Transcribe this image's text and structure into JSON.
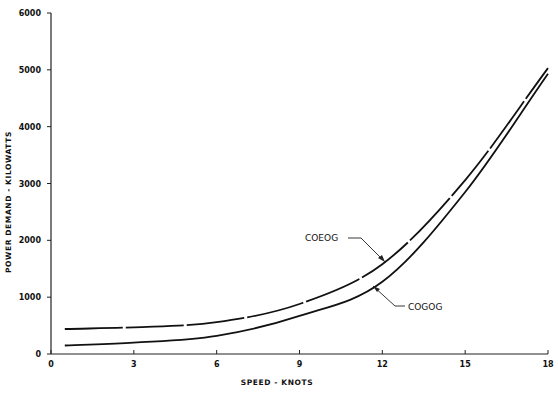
{
  "chart_data": {
    "type": "line",
    "title": "",
    "xlabel": "SPEED - KNOTS",
    "ylabel": "POWER DEMAND - KILOWATTS",
    "xlim": [
      0,
      18
    ],
    "ylim": [
      0,
      6000
    ],
    "x_ticks": [
      0,
      3,
      6,
      9,
      12,
      15,
      18
    ],
    "x_tick_labels": [
      "0",
      "3",
      "6",
      "9",
      "12",
      "15",
      "18"
    ],
    "y_ticks": [
      0,
      1000,
      2000,
      3000,
      4000,
      5000,
      6000
    ],
    "y_tick_labels": [
      "0",
      "1000",
      "2000",
      "3000",
      "4000",
      "5000",
      "6000"
    ],
    "grid": false,
    "legend": "inline annotations with leader arrows",
    "x": [
      0.5,
      3,
      6,
      9,
      12,
      15,
      18
    ],
    "series": [
      {
        "name": "COEOG",
        "style": "long-dash",
        "values": [
          440,
          470,
          560,
          880,
          1580,
          3060,
          5030
        ]
      },
      {
        "name": "COGOG",
        "style": "solid",
        "values": [
          150,
          200,
          320,
          670,
          1270,
          2850,
          4930
        ]
      }
    ],
    "annotations": [
      {
        "text": "COEOG",
        "points_to_x": 12.0
      },
      {
        "text": "COGOG",
        "points_to_x": 11.5
      }
    ]
  },
  "labels": {
    "xlabel": "SPEED - KNOTS",
    "ylabel": "POWER DEMAND - KILOWATTS",
    "coeog": "COEOG",
    "cogog": "COGOG"
  }
}
